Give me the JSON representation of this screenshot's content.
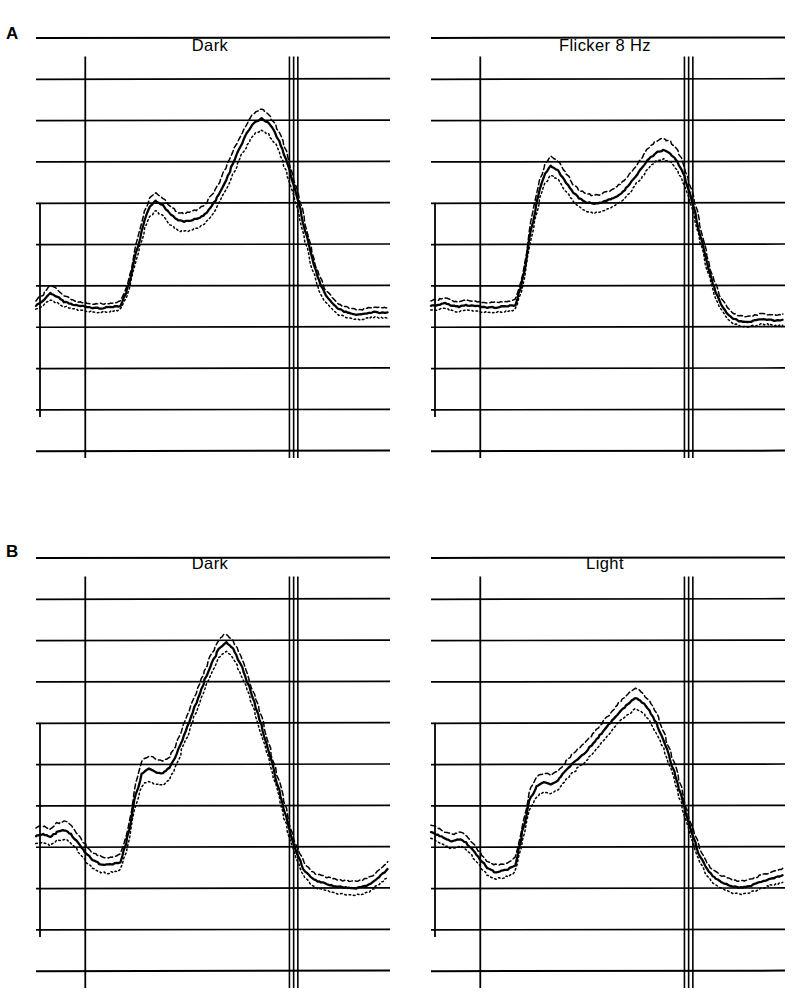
{
  "figure": {
    "width": 797,
    "height": 994,
    "background": "#ffffff",
    "ink_color": "#000000"
  },
  "panels": [
    {
      "letter": "A",
      "plots": [
        {
          "title": "Dark",
          "side": "left"
        },
        {
          "title": "Flicker 8 Hz",
          "side": "right"
        }
      ]
    },
    {
      "letter": "B",
      "plots": [
        {
          "title": "Dark",
          "side": "left"
        },
        {
          "title": "Light",
          "side": "right"
        }
      ]
    }
  ],
  "chart_data": {
    "type": "line",
    "title": "",
    "xlabel": "",
    "ylabel": "",
    "grid": true,
    "legend_position": "none",
    "series_style": {
      "mean": "solid",
      "upper_band": "dashed",
      "lower_band": "dotted"
    },
    "axis": {
      "x_range": [
        0,
        100
      ],
      "y_range": [
        0,
        10
      ],
      "gridline_count": 11,
      "gridline_spacing_units": 1,
      "onset_marker_x": 14,
      "offset_marker_x": 72,
      "offset_marker_line_count": 3,
      "calibration_bar_y_span": [
        2.0,
        5.0
      ]
    },
    "plots": [
      {
        "id": "A-left",
        "panel": "A",
        "title": "Dark",
        "baseline_y": 3.5,
        "x": [
          0,
          2,
          4,
          6,
          8,
          10,
          12,
          14,
          16,
          18,
          20,
          22,
          24,
          26,
          28,
          30,
          32,
          34,
          36,
          38,
          40,
          42,
          44,
          46,
          48,
          50,
          52,
          54,
          56,
          58,
          60,
          62,
          64,
          66,
          68,
          70,
          72,
          74,
          76,
          78,
          80,
          82,
          84,
          86,
          88,
          90,
          92,
          94,
          96,
          98,
          100
        ],
        "series": [
          {
            "name": "mean",
            "style": "solid",
            "values": [
              3.5,
              3.62,
              3.8,
              3.72,
              3.6,
              3.55,
              3.5,
              3.48,
              3.45,
              3.44,
              3.46,
              3.48,
              3.5,
              3.9,
              4.6,
              5.3,
              5.85,
              6.05,
              5.95,
              5.75,
              5.6,
              5.55,
              5.58,
              5.62,
              5.72,
              5.92,
              6.2,
              6.55,
              6.95,
              7.35,
              7.7,
              7.95,
              8.05,
              7.95,
              7.7,
              7.3,
              6.8,
              6.2,
              5.5,
              4.8,
              4.2,
              3.8,
              3.58,
              3.42,
              3.35,
              3.3,
              3.28,
              3.32,
              3.35,
              3.33,
              3.34
            ]
          },
          {
            "name": "upper_band",
            "style": "dashed",
            "values": [
              3.62,
              3.78,
              4.0,
              3.9,
              3.74,
              3.66,
              3.6,
              3.58,
              3.55,
              3.54,
              3.56,
              3.58,
              3.6,
              4.04,
              4.78,
              5.5,
              6.08,
              6.25,
              6.12,
              5.92,
              5.78,
              5.74,
              5.78,
              5.84,
              5.96,
              6.18,
              6.48,
              6.85,
              7.25,
              7.62,
              7.95,
              8.18,
              8.28,
              8.16,
              7.9,
              7.5,
              7.0,
              6.38,
              5.68,
              4.96,
              4.34,
              3.92,
              3.7,
              3.54,
              3.47,
              3.42,
              3.4,
              3.44,
              3.47,
              3.45,
              3.46
            ]
          },
          {
            "name": "lower_band",
            "style": "dotted",
            "values": [
              3.4,
              3.5,
              3.64,
              3.58,
              3.48,
              3.44,
              3.4,
              3.38,
              3.35,
              3.34,
              3.36,
              3.38,
              3.4,
              3.78,
              4.44,
              5.12,
              5.62,
              5.8,
              5.68,
              5.48,
              5.34,
              5.3,
              5.34,
              5.4,
              5.5,
              5.7,
              5.98,
              6.32,
              6.7,
              7.08,
              7.42,
              7.66,
              7.76,
              7.66,
              7.42,
              7.02,
              6.52,
              5.92,
              5.22,
              4.54,
              3.96,
              3.6,
              3.42,
              3.28,
              3.22,
              3.18,
              3.16,
              3.2,
              3.23,
              3.21,
              3.22
            ]
          }
        ]
      },
      {
        "id": "A-right",
        "panel": "A",
        "title": "Flicker 8 Hz",
        "baseline_y": 3.5,
        "x": [
          0,
          2,
          4,
          6,
          8,
          10,
          12,
          14,
          16,
          18,
          20,
          22,
          24,
          26,
          28,
          30,
          32,
          34,
          36,
          38,
          40,
          42,
          44,
          46,
          48,
          50,
          52,
          54,
          56,
          58,
          60,
          62,
          64,
          66,
          68,
          70,
          72,
          74,
          76,
          78,
          80,
          82,
          84,
          86,
          88,
          90,
          92,
          94,
          96,
          98,
          100
        ],
        "series": [
          {
            "name": "mean",
            "style": "solid",
            "values": [
              3.5,
              3.52,
              3.56,
              3.5,
              3.48,
              3.52,
              3.5,
              3.48,
              3.46,
              3.46,
              3.48,
              3.5,
              3.52,
              4.1,
              5.1,
              6.0,
              6.62,
              6.9,
              6.8,
              6.55,
              6.3,
              6.12,
              6.02,
              5.98,
              6.0,
              6.05,
              6.12,
              6.22,
              6.4,
              6.62,
              6.85,
              7.08,
              7.22,
              7.28,
              7.2,
              7.0,
              6.65,
              6.1,
              5.4,
              4.68,
              4.05,
              3.6,
              3.32,
              3.18,
              3.12,
              3.1,
              3.14,
              3.18,
              3.16,
              3.14,
              3.16
            ]
          },
          {
            "name": "upper_band",
            "style": "dashed",
            "values": [
              3.62,
              3.65,
              3.7,
              3.62,
              3.6,
              3.64,
              3.62,
              3.6,
              3.58,
              3.58,
              3.6,
              3.62,
              3.64,
              4.26,
              5.3,
              6.22,
              6.86,
              7.14,
              7.02,
              6.76,
              6.5,
              6.32,
              6.22,
              6.18,
              6.2,
              6.26,
              6.34,
              6.46,
              6.64,
              6.88,
              7.12,
              7.35,
              7.5,
              7.56,
              7.48,
              7.26,
              6.9,
              6.34,
              5.62,
              4.88,
              4.22,
              3.75,
              3.46,
              3.31,
              3.25,
              3.23,
              3.27,
              3.31,
              3.29,
              3.27,
              3.29
            ]
          },
          {
            "name": "lower_band",
            "style": "dotted",
            "values": [
              3.38,
              3.4,
              3.44,
              3.38,
              3.36,
              3.4,
              3.38,
              3.36,
              3.34,
              3.34,
              3.36,
              3.38,
              3.4,
              3.96,
              4.92,
              5.8,
              6.4,
              6.66,
              6.56,
              6.32,
              6.08,
              5.9,
              5.8,
              5.76,
              5.78,
              5.84,
              5.92,
              6.02,
              6.2,
              6.42,
              6.64,
              6.86,
              7.0,
              7.06,
              6.98,
              6.78,
              6.44,
              5.9,
              5.22,
              4.52,
              3.9,
              3.46,
              3.19,
              3.06,
              3.0,
              2.98,
              3.02,
              3.06,
              3.04,
              3.02,
              3.04
            ]
          }
        ]
      },
      {
        "id": "B-left",
        "panel": "B",
        "title": "Dark",
        "baseline_y": 2.6,
        "x": [
          0,
          2,
          4,
          6,
          8,
          10,
          12,
          14,
          16,
          18,
          20,
          22,
          24,
          26,
          28,
          30,
          32,
          34,
          36,
          38,
          40,
          42,
          44,
          46,
          48,
          50,
          52,
          54,
          56,
          58,
          60,
          62,
          64,
          66,
          68,
          70,
          72,
          74,
          76,
          78,
          80,
          82,
          84,
          86,
          88,
          90,
          92,
          94,
          96,
          98,
          100
        ],
        "series": [
          {
            "name": "mean",
            "style": "solid",
            "values": [
              3.25,
              3.3,
              3.22,
              3.35,
              3.4,
              3.3,
              3.08,
              2.85,
              2.68,
              2.58,
              2.55,
              2.58,
              2.62,
              3.2,
              4.1,
              4.75,
              4.88,
              4.8,
              4.78,
              4.9,
              5.25,
              5.7,
              6.15,
              6.6,
              7.05,
              7.45,
              7.8,
              7.95,
              7.8,
              7.45,
              7.0,
              6.5,
              5.95,
              5.35,
              4.7,
              4.05,
              3.4,
              2.85,
              2.45,
              2.25,
              2.15,
              2.1,
              2.05,
              2.02,
              2.0,
              1.98,
              2.0,
              2.05,
              2.15,
              2.3,
              2.45
            ]
          },
          {
            "name": "upper_band",
            "style": "dashed",
            "values": [
              3.45,
              3.5,
              3.42,
              3.56,
              3.62,
              3.52,
              3.28,
              3.05,
              2.86,
              2.76,
              2.73,
              2.76,
              2.8,
              3.4,
              4.34,
              5.05,
              5.2,
              5.12,
              5.08,
              5.18,
              5.52,
              5.96,
              6.4,
              6.84,
              7.28,
              7.68,
              8.02,
              8.16,
              8.0,
              7.65,
              7.2,
              6.7,
              6.15,
              5.55,
              4.9,
              4.25,
              3.58,
              3.02,
              2.62,
              2.42,
              2.32,
              2.27,
              2.22,
              2.19,
              2.17,
              2.15,
              2.17,
              2.22,
              2.32,
              2.47,
              2.62
            ]
          },
          {
            "name": "lower_band",
            "style": "dotted",
            "values": [
              3.05,
              3.1,
              3.02,
              3.14,
              3.18,
              3.08,
              2.88,
              2.65,
              2.48,
              2.38,
              2.35,
              2.38,
              2.42,
              3.0,
              3.88,
              4.48,
              4.58,
              4.5,
              4.48,
              4.62,
              5.0,
              5.46,
              5.92,
              6.38,
              6.84,
              7.24,
              7.58,
              7.72,
              7.58,
              7.24,
              6.8,
              6.3,
              5.75,
              5.15,
              4.5,
              3.85,
              3.22,
              2.68,
              2.28,
              2.08,
              1.98,
              1.93,
              1.88,
              1.85,
              1.83,
              1.81,
              1.83,
              1.88,
              1.98,
              2.13,
              2.28
            ]
          }
        ]
      },
      {
        "id": "B-right",
        "panel": "B",
        "title": "Light",
        "baseline_y": 2.6,
        "x": [
          0,
          2,
          4,
          6,
          8,
          10,
          12,
          14,
          16,
          18,
          20,
          22,
          24,
          26,
          28,
          30,
          32,
          34,
          36,
          38,
          40,
          42,
          44,
          46,
          48,
          50,
          52,
          54,
          56,
          58,
          60,
          62,
          64,
          66,
          68,
          70,
          72,
          74,
          76,
          78,
          80,
          82,
          84,
          86,
          88,
          90,
          92,
          94,
          96,
          98,
          100
        ],
        "series": [
          {
            "name": "mean",
            "style": "solid",
            "values": [
              3.35,
              3.28,
              3.18,
              3.12,
              3.18,
              3.1,
              2.9,
              2.68,
              2.48,
              2.38,
              2.4,
              2.45,
              2.55,
              3.35,
              4.1,
              4.45,
              4.55,
              4.5,
              4.6,
              4.8,
              5.0,
              5.15,
              5.3,
              5.5,
              5.7,
              5.9,
              6.1,
              6.3,
              6.45,
              6.6,
              6.5,
              6.3,
              6.0,
              5.6,
              5.1,
              4.55,
              3.95,
              3.35,
              2.85,
              2.5,
              2.28,
              2.15,
              2.08,
              2.02,
              2.0,
              2.02,
              2.08,
              2.15,
              2.2,
              2.25,
              2.3
            ]
          },
          {
            "name": "upper_band",
            "style": "dashed",
            "values": [
              3.52,
              3.45,
              3.35,
              3.29,
              3.35,
              3.27,
              3.07,
              2.85,
              2.65,
              2.55,
              2.57,
              2.62,
              2.72,
              3.54,
              4.32,
              4.68,
              4.78,
              4.73,
              4.83,
              5.03,
              5.23,
              5.38,
              5.53,
              5.73,
              5.93,
              6.13,
              6.33,
              6.53,
              6.7,
              6.85,
              6.74,
              6.54,
              6.23,
              5.82,
              5.31,
              4.75,
              4.14,
              3.53,
              3.02,
              2.66,
              2.44,
              2.31,
              2.24,
              2.18,
              2.16,
              2.18,
              2.24,
              2.31,
              2.36,
              2.41,
              2.46
            ]
          },
          {
            "name": "lower_band",
            "style": "dotted",
            "values": [
              3.18,
              3.11,
              3.01,
              2.95,
              3.01,
              2.93,
              2.73,
              2.51,
              2.31,
              2.21,
              2.23,
              2.28,
              2.38,
              3.16,
              3.88,
              4.22,
              4.32,
              4.27,
              4.37,
              4.57,
              4.77,
              4.92,
              5.07,
              5.27,
              5.47,
              5.67,
              5.87,
              6.07,
              6.2,
              6.35,
              6.26,
              6.06,
              5.77,
              5.38,
              4.89,
              4.35,
              3.76,
              3.17,
              2.68,
              2.34,
              2.12,
              1.99,
              1.92,
              1.86,
              1.84,
              1.86,
              1.92,
              1.99,
              2.04,
              2.09,
              2.14
            ]
          }
        ]
      }
    ]
  }
}
